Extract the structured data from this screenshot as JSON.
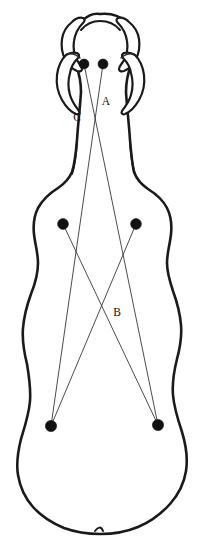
{
  "figure": {
    "view": "dorsal",
    "background_color": "#ffffff",
    "outline_color": "#1a1a1a",
    "landmark_color": "#111111",
    "measure_line_color": "#2b2b2b"
  },
  "labels": [
    {
      "id": "A",
      "text": "A",
      "x": 106,
      "y": 105
    },
    {
      "id": "B",
      "text": "B",
      "x": 117,
      "y": 316
    },
    {
      "id": "C",
      "text": "C",
      "x": 77,
      "y": 121
    }
  ],
  "landmarks": [
    {
      "id": "P1",
      "name": "left-poll-landmark",
      "x": 84,
      "y": 64,
      "r": 5.0
    },
    {
      "id": "P2",
      "name": "right-poll-landmark",
      "x": 103,
      "y": 64,
      "r": 5.0
    },
    {
      "id": "P3",
      "name": "left-shoulder-landmark",
      "x": 63,
      "y": 224,
      "r": 5.4
    },
    {
      "id": "P4",
      "name": "right-shoulder-landmark",
      "x": 136,
      "y": 224,
      "r": 5.4
    },
    {
      "id": "P5",
      "name": "left-hip-landmark",
      "x": 51,
      "y": 426,
      "r": 5.6
    },
    {
      "id": "P6",
      "name": "right-hip-landmark",
      "x": 158,
      "y": 425,
      "r": 5.6
    }
  ],
  "measurements": [
    {
      "id": "M1",
      "name": "poll-left-to-hip-right",
      "from": "P1",
      "to": "P6",
      "label": "A"
    },
    {
      "id": "M2",
      "name": "poll-right-to-hip-left",
      "from": "P2",
      "to": "P5",
      "label": "C"
    },
    {
      "id": "M3",
      "name": "shoulder-left-to-hip-right",
      "from": "P3",
      "to": "P6",
      "label": "B"
    },
    {
      "id": "M4",
      "name": "shoulder-right-to-hip-left",
      "from": "P4",
      "to": "P5",
      "label": "B"
    }
  ],
  "paths": {
    "body_outline": "M 100 14 C 110 13 120 16 126 22 C 131 27 134 34 135 41 C 136 50 134 58 131 65 C 128 73 126 82 126 92 C 127 108 129 124 130 140 C 131 152 132 163 134 172 C 137 180 142 185 148 189 C 156 194 163 200 167 208 C 171 216 172 225 171 234 C 170 244 167 253 167 263 C 167 273 170 282 173 291 C 177 302 180 313 181 325 C 182 337 180 348 177 359 C 174 371 172 383 173 395 C 174 408 178 420 182 432 C 186 445 188 458 186 471 C 184 484 178 495 170 504 C 161 514 150 522 138 527 C 126 532 113 534 100 534 C 88 534 75 532 64 528 C 52 523 41 516 33 507 C 25 498 20 487 18 475 C 16 463 18 451 21 439 C 25 426 29 414 30 401 C 31 388 29 376 27 364 C 24 352 22 340 23 328 C 24 316 27 305 31 294 C 35 284 38 273 38 263 C 38 253 35 244 34 234 C 33 225 34 216 38 208 C 43 199 50 193 58 188 C 64 184 69 179 72 172 C 75 163 76 152 77 140 C 78 124 80 108 81 92 C 81 82 79 73 76 65 C 73 58 71 50 72 41 C 73 34 76 27 81 22 C 87 16 92 13 100 14 Z",
    "left_horn": "M 72 22 C 67 26 63 32 62 39 C 61 46 62 53 65 59 C 68 65 72 69 77 71 C 80 72 82 71 82 69 C 82 66 79 64 77 60 C 74 54 73 47 74 41 C 75 34 78 28 83 23 C 85 21 85 19 83 18 C 79 17 75 19 72 22 Z",
    "right_horn": "M 129 22 C 134 26 138 32 139 39 C 140 46 139 53 136 59 C 133 65 129 69 124 71 C 121 72 119 71 119 69 C 119 66 122 64 124 60 C 127 54 128 47 127 41 C 126 34 123 28 118 23 C 116 21 116 19 118 18 C 122 17 126 19 129 22 Z",
    "left_ear": "M 66 55 C 61 60 58 67 57 75 C 56 84 58 93 62 100 C 66 107 71 112 76 114 C 79 115 80 113 79 111 C 76 107 72 102 70 95 C 68 88 68 80 70 73 C 71 67 74 62 78 58 C 80 56 79 54 77 53 C 73 52 69 53 66 55 Z",
    "right_ear": "M 135 55 C 140 60 143 67 144 75 C 145 84 143 93 139 100 C 135 107 130 112 125 114 C 122 115 121 113 122 111 C 125 107 129 102 131 95 C 133 88 133 80 131 73 C 130 67 127 62 123 58 C 121 56 122 54 124 53 C 128 52 132 53 135 55 Z",
    "forehead_crest": "M 81 30 C 86 24 93 21 100 21 C 108 21 115 24 120 30",
    "muzzle_ridge_left": "M 67 54 C 72 53 77 55 80 58",
    "muzzle_ridge_right": "M 134 54 C 129 53 124 55 121 58",
    "neck_left_fold": "M 77 142 C 76 155 75 166 72 174",
    "neck_right_fold": "M 130 142 C 131 155 132 166 135 174",
    "tail_notch": "M 95 531 C 98 527 101 526 103 531"
  }
}
